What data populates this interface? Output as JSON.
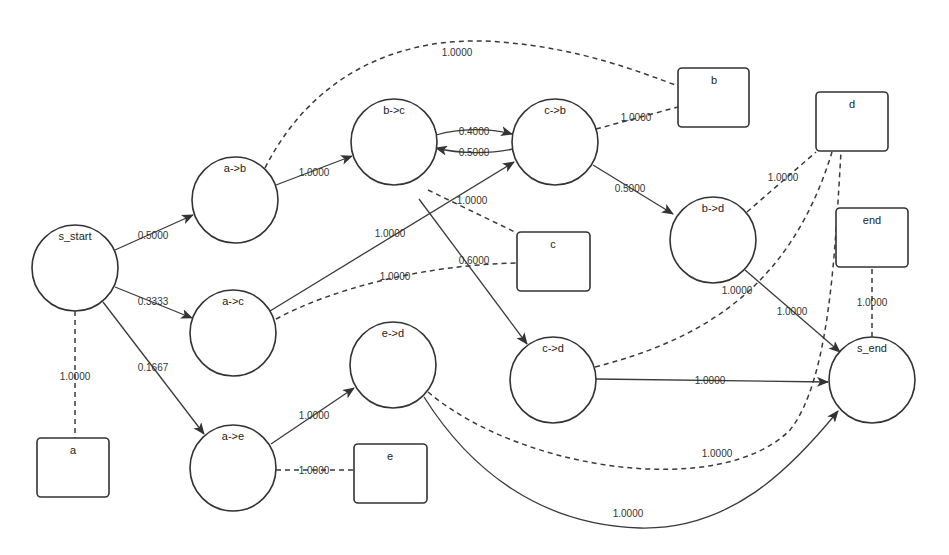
{
  "diagram": {
    "type": "probabilistic-transition-graph",
    "state_nodes": [
      {
        "id": "s_start",
        "label": "s_start"
      },
      {
        "id": "ab",
        "label": "a->b"
      },
      {
        "id": "ac",
        "label": "a->c"
      },
      {
        "id": "ae",
        "label": "a->e"
      },
      {
        "id": "bc",
        "label": "b->c"
      },
      {
        "id": "cb",
        "label": "c->b"
      },
      {
        "id": "bd",
        "label": "b->d"
      },
      {
        "id": "ed",
        "label": "e->d"
      },
      {
        "id": "cd",
        "label": "c->d"
      },
      {
        "id": "s_end",
        "label": "s_end"
      }
    ],
    "emission_nodes": [
      {
        "id": "a",
        "label": "a"
      },
      {
        "id": "b",
        "label": "b"
      },
      {
        "id": "c",
        "label": "c"
      },
      {
        "id": "d",
        "label": "d"
      },
      {
        "id": "e",
        "label": "e"
      },
      {
        "id": "end",
        "label": "end"
      }
    ],
    "transitions": [
      {
        "from": "s_start",
        "to": "a->b",
        "weight": "0.5000"
      },
      {
        "from": "s_start",
        "to": "a->c",
        "weight": "0.3333"
      },
      {
        "from": "s_start",
        "to": "a->e",
        "weight": "0.1667"
      },
      {
        "from": "a->b",
        "to": "b->c",
        "weight": "1.0000"
      },
      {
        "from": "a->c",
        "to": "c->b",
        "weight": "1.0000"
      },
      {
        "from": "a->e",
        "to": "e->d",
        "weight": "1.0000"
      },
      {
        "from": "b->c",
        "to": "c->b",
        "weight": "0.4000"
      },
      {
        "from": "c->b",
        "to": "b->c",
        "weight": "0.5000"
      },
      {
        "from": "b->c",
        "to": "c->d",
        "weight": "0.6000"
      },
      {
        "from": "c->b",
        "to": "b->d",
        "weight": "0.5000"
      },
      {
        "from": "b->d",
        "to": "s_end",
        "weight": "1.0000"
      },
      {
        "from": "c->d",
        "to": "s_end",
        "weight": "1.0000"
      },
      {
        "from": "e->d",
        "to": "s_end",
        "weight": "1.0000"
      }
    ],
    "emissions": [
      {
        "state": "s_start",
        "symbol": "a",
        "weight": "1.0000"
      },
      {
        "state": "a->b",
        "symbol": "b",
        "weight": "1.0000"
      },
      {
        "state": "c->b",
        "symbol": "b",
        "weight": "1.0000"
      },
      {
        "state": "b->c",
        "symbol": "c",
        "weight": "1.0000"
      },
      {
        "state": "a->c",
        "symbol": "c",
        "weight": "1.0000"
      },
      {
        "state": "b->d",
        "symbol": "d",
        "weight": "1.0000"
      },
      {
        "state": "c->d",
        "symbol": "d",
        "weight": "1.0000"
      },
      {
        "state": "e->d",
        "symbol": "d",
        "weight": "1.0000"
      },
      {
        "state": "a->e",
        "symbol": "e",
        "weight": "1.0000"
      },
      {
        "state": "s_end",
        "symbol": "end",
        "weight": "1.0000"
      }
    ],
    "colors": {
      "stroke": "#333333",
      "background": "#ffffff"
    }
  }
}
